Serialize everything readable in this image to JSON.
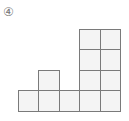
{
  "label": "④",
  "grid": {
    "origin_x": 18,
    "origin_y": 29,
    "cell_size": 20.4,
    "columns": 5,
    "rows": 4,
    "line_color": "#7a7a7a",
    "fill_color": "#f4f4f4",
    "cells": [
      {
        "row": 0,
        "col": 3
      },
      {
        "row": 0,
        "col": 4
      },
      {
        "row": 1,
        "col": 3
      },
      {
        "row": 1,
        "col": 4
      },
      {
        "row": 2,
        "col": 1
      },
      {
        "row": 2,
        "col": 3
      },
      {
        "row": 2,
        "col": 4
      },
      {
        "row": 3,
        "col": 0
      },
      {
        "row": 3,
        "col": 1
      },
      {
        "row": 3,
        "col": 2
      },
      {
        "row": 3,
        "col": 3
      },
      {
        "row": 3,
        "col": 4
      }
    ],
    "column_heights": [
      1,
      2,
      1,
      4,
      4
    ]
  }
}
